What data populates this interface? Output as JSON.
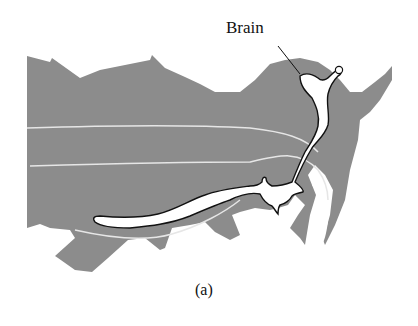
{
  "figure": {
    "annotation_label": "Brain",
    "caption": "(a)",
    "colors": {
      "tissue_fill": "#8c8c8c",
      "cavity_fill": "#ffffff",
      "outline": "#111111",
      "guide_lines": "#e6e6e6"
    }
  }
}
